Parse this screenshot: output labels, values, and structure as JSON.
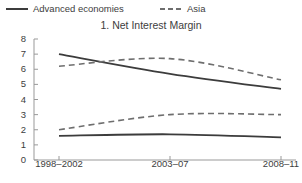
{
  "legend": {
    "items": [
      {
        "label": "Advanced economies",
        "style": "solid",
        "color": "#3c3c3c",
        "icon": "solid-line-icon"
      },
      {
        "label": "Asia",
        "style": "dashed",
        "color": "#6e6e6e",
        "icon": "dashed-line-icon"
      }
    ]
  },
  "chart_data": {
    "type": "line",
    "title": "1. Net Interest Margin",
    "xlabel": "",
    "ylabel": "",
    "categories": [
      "1998–2002",
      "2003–07",
      "2008–11"
    ],
    "ylim": [
      0,
      8
    ],
    "yticks": [
      0,
      1,
      2,
      3,
      4,
      5,
      6,
      7,
      8
    ],
    "yticklabels": [
      "0",
      "1",
      "2",
      "3",
      "4",
      "5",
      "6",
      "7",
      "8"
    ],
    "grid": false,
    "legend_position": "above-top-left",
    "series": [
      {
        "name": "Advanced economies (upper)",
        "style": "solid",
        "color": "#3c3c3c",
        "values": [
          7.0,
          5.7,
          4.7
        ]
      },
      {
        "name": "Asia (upper)",
        "style": "dashed",
        "color": "#6e6e6e",
        "values": [
          6.2,
          6.7,
          5.3
        ]
      },
      {
        "name": "Asia (lower)",
        "style": "dashed",
        "color": "#6e6e6e",
        "values": [
          2.0,
          3.0,
          3.0
        ]
      },
      {
        "name": "Advanced economies (lower)",
        "style": "solid",
        "color": "#3c3c3c",
        "values": [
          1.6,
          1.7,
          1.5
        ]
      }
    ]
  }
}
